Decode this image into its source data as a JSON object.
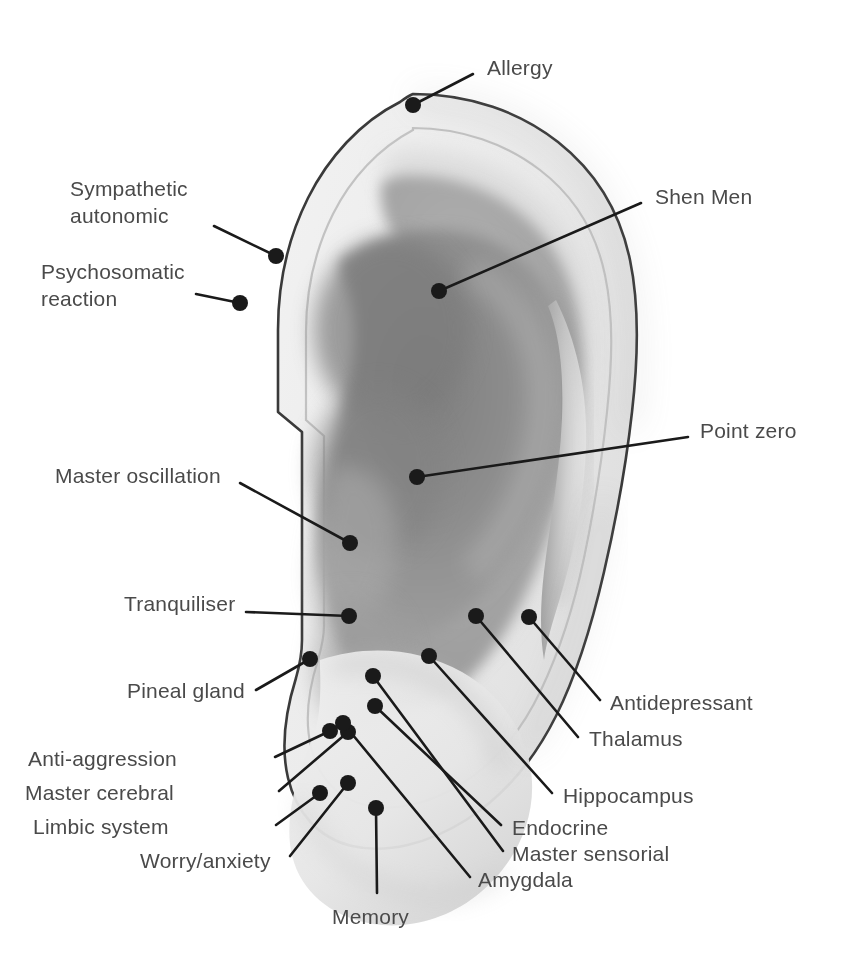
{
  "figure": {
    "orientation": "right ear, lateral view",
    "style": "grayscale halftone anatomical illustration",
    "point_count": 18
  },
  "colors": {
    "background": "#ffffff",
    "outline": "#3a3a3a",
    "helix_light": "#f0f0f0",
    "helix_mid": "#e2e2e2",
    "concha_mid": "#909090",
    "concha_shadow": "#858585",
    "antihelix": "#a8a8a8",
    "lobe_light": "#ededed",
    "lobe_shadow": "#c9c9c9",
    "marker_dot": "#1a1a1a",
    "leader_line": "#1a1a1a",
    "label_text": "#4a4a4a"
  },
  "points": [
    {
      "id": "allergy",
      "label": "Allergy",
      "label_x": 487,
      "label_y": 54,
      "align": "left",
      "dot_x": 413,
      "dot_y": 105,
      "line_x": 473,
      "line_y": 74
    },
    {
      "id": "sympathetic-autonomic",
      "label": "Sympathetic\nautonomic",
      "label_x": 70,
      "label_y": 175,
      "align": "left",
      "dot_x": 276,
      "dot_y": 256,
      "line_x": 214,
      "line_y": 226
    },
    {
      "id": "shen-men",
      "label": "Shen Men",
      "label_x": 655,
      "label_y": 183,
      "align": "left",
      "dot_x": 439,
      "dot_y": 291,
      "line_x": 641,
      "line_y": 203
    },
    {
      "id": "psychosomatic-reaction",
      "label": "Psychosomatic\nreaction",
      "label_x": 41,
      "label_y": 258,
      "align": "left",
      "dot_x": 240,
      "dot_y": 303,
      "line_x": 196,
      "line_y": 294
    },
    {
      "id": "point-zero",
      "label": "Point zero",
      "label_x": 700,
      "label_y": 417,
      "align": "left",
      "dot_x": 417,
      "dot_y": 477,
      "line_x": 688,
      "line_y": 437
    },
    {
      "id": "master-oscillation",
      "label": "Master oscillation",
      "label_x": 55,
      "label_y": 462,
      "align": "left",
      "dot_x": 350,
      "dot_y": 543,
      "line_x": 240,
      "line_y": 483
    },
    {
      "id": "tranquiliser",
      "label": "Tranquiliser",
      "label_x": 124,
      "label_y": 590,
      "align": "left",
      "dot_x": 349,
      "dot_y": 616,
      "line_x": 246,
      "line_y": 612
    },
    {
      "id": "antidepressant",
      "label": "Antidepressant",
      "label_x": 610,
      "label_y": 689,
      "align": "left",
      "dot_x": 529,
      "dot_y": 617,
      "line_x": 600,
      "line_y": 700
    },
    {
      "id": "thalamus",
      "label": "Thalamus",
      "label_x": 589,
      "label_y": 725,
      "align": "left",
      "dot_x": 476,
      "dot_y": 616,
      "line_x": 578,
      "line_y": 737
    },
    {
      "id": "pineal-gland",
      "label": "Pineal gland",
      "label_x": 127,
      "label_y": 677,
      "align": "left",
      "dot_x": 310,
      "dot_y": 659,
      "line_x": 256,
      "line_y": 690
    },
    {
      "id": "hippocampus",
      "label": "Hippocampus",
      "label_x": 563,
      "label_y": 782,
      "align": "left",
      "dot_x": 429,
      "dot_y": 656,
      "line_x": 552,
      "line_y": 793
    },
    {
      "id": "anti-aggression",
      "label": "Anti-aggression",
      "label_x": 28,
      "label_y": 745,
      "align": "left",
      "dot_x": 330,
      "dot_y": 731,
      "line_x": 275,
      "line_y": 757
    },
    {
      "id": "master-cerebral",
      "label": "Master cerebral",
      "label_x": 25,
      "label_y": 779,
      "align": "left",
      "dot_x": 348,
      "dot_y": 732,
      "line_x": 279,
      "line_y": 791
    },
    {
      "id": "endocrine",
      "label": "Endocrine",
      "label_x": 512,
      "label_y": 814,
      "align": "left",
      "dot_x": 375,
      "dot_y": 706,
      "line_x": 501,
      "line_y": 825
    },
    {
      "id": "limbic-system",
      "label": "Limbic system",
      "label_x": 33,
      "label_y": 813,
      "align": "left",
      "dot_x": 320,
      "dot_y": 793,
      "line_x": 276,
      "line_y": 825
    },
    {
      "id": "master-sensorial",
      "label": "Master sensorial",
      "label_x": 512,
      "label_y": 840,
      "align": "left",
      "dot_x": 373,
      "dot_y": 676,
      "line_x": 503,
      "line_y": 851
    },
    {
      "id": "worry-anxiety",
      "label": "Worry/anxiety",
      "label_x": 140,
      "label_y": 847,
      "align": "left",
      "dot_x": 348,
      "dot_y": 783,
      "line_x": 290,
      "line_y": 856
    },
    {
      "id": "amygdala",
      "label": "Amygdala",
      "label_x": 478,
      "label_y": 866,
      "align": "left",
      "dot_x": 343,
      "dot_y": 723,
      "line_x": 470,
      "line_y": 877
    },
    {
      "id": "memory",
      "label": "Memory",
      "label_x": 332,
      "label_y": 903,
      "align": "left",
      "dot_x": 376,
      "dot_y": 808,
      "line_x": 377,
      "line_y": 893
    }
  ]
}
